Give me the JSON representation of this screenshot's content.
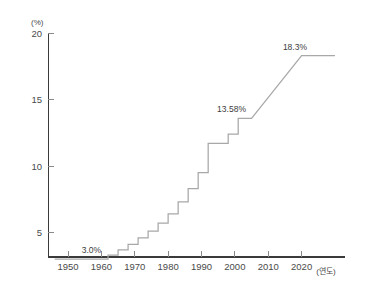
{
  "chart_data": {
    "type": "line",
    "title": "",
    "subtitle": "",
    "xlabel": "(연도)",
    "ylabel": "(%)",
    "xlim": [
      1944,
      2033
    ],
    "ylim": [
      2.0,
      20.6
    ],
    "grid": false,
    "legend": null,
    "step_style": "post",
    "series": [
      {
        "name": "비율",
        "x": [
          1946,
          1960,
          1962,
          1965,
          1968,
          1971,
          1974,
          1977,
          1980,
          1983,
          1986,
          1989,
          1992,
          1998,
          2001,
          2005,
          2020,
          2030
        ],
        "values": [
          3.0,
          3.0,
          3.3,
          3.7,
          4.1,
          4.6,
          5.1,
          5.7,
          6.4,
          7.3,
          8.3,
          9.5,
          11.7,
          12.4,
          13.58,
          13.58,
          18.3,
          18.3
        ]
      }
    ],
    "annotations": [
      {
        "label": "3.0%",
        "x": 1957,
        "y": 3.0,
        "value": 3.0
      },
      {
        "label": "13.58%",
        "x": 1999,
        "y": 13.58,
        "value": 13.58
      },
      {
        "label": "18.3%",
        "x": 2018,
        "y": 18.3,
        "value": 18.3
      }
    ],
    "xticks": [
      1950,
      1960,
      1970,
      1980,
      1990,
      2000,
      2010,
      2020
    ],
    "xtick_labels": [
      "1950",
      "1960",
      "1970",
      "1980",
      "1990",
      "2000",
      "2010",
      "2020"
    ],
    "yticks": [
      5,
      10,
      15,
      20
    ],
    "ytick_labels": [
      "5",
      "10",
      "15",
      "20"
    ],
    "colors": {
      "line": "#a8a8a8",
      "axis": "#3a3a3a",
      "tick": "#8a8a8a",
      "text": "#4a4a4a",
      "background": "#ffffff"
    }
  }
}
